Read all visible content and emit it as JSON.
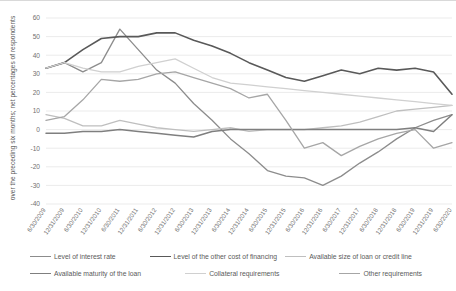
{
  "chart_data": {
    "type": "line",
    "title": "",
    "xlabel": "",
    "ylabel": "over the preceding six months; net percentages of respondents",
    "ylim": [
      -40,
      60
    ],
    "yticks": [
      60,
      50,
      40,
      30,
      20,
      10,
      0,
      -10,
      -20,
      -30,
      -40
    ],
    "grid": true,
    "legend_position": "bottom",
    "categories": [
      "6/30/2009",
      "12/31/2009",
      "6/30/2010",
      "12/31/2010",
      "6/30/2011",
      "12/31/2011",
      "6/30/2012",
      "12/31/2012",
      "6/30/2013",
      "12/31/2013",
      "6/30/2014",
      "12/31/2014",
      "6/30/2015",
      "12/31/2015",
      "6/30/2016",
      "12/31/2016",
      "6/30/2017",
      "12/31/2017",
      "6/30/2018",
      "12/31/2018",
      "6/30/2019",
      "12/31/2019",
      "6/30/2020"
    ],
    "series": [
      {
        "name": "Level of interest rate",
        "color": "#8c8c8c",
        "width": 1.3,
        "values": [
          33,
          36,
          31,
          36,
          54,
          43,
          32,
          25,
          14,
          5,
          -5,
          -13,
          -22,
          -25,
          -26,
          -30,
          -25,
          -18,
          -12,
          -5,
          1,
          5,
          8
        ]
      },
      {
        "name": "Level of the other cost of financing",
        "color": "#595959",
        "width": 1.6,
        "values": [
          33,
          36,
          43,
          49,
          50,
          50,
          52,
          52,
          48,
          45,
          41,
          36,
          32,
          28,
          26,
          29,
          32,
          30,
          33,
          32,
          33,
          31,
          19
        ]
      },
      {
        "name": "Available size of loan or credit line",
        "color": "#bfbfbf",
        "width": 1.3,
        "values": [
          8,
          6,
          2,
          2,
          5,
          3,
          1,
          0,
          -1,
          0,
          1,
          -1,
          0,
          0,
          0,
          1,
          2,
          4,
          7,
          10,
          11,
          12,
          13
        ]
      },
      {
        "name": "Available maturity of the loan",
        "color": "#7f7f7f",
        "width": 1.5,
        "values": [
          -2,
          -2,
          -1,
          -1,
          0,
          -1,
          -2,
          -3,
          -4,
          -1,
          0,
          0,
          0,
          0,
          0,
          0,
          0,
          0,
          0,
          0,
          1,
          -1,
          8
        ]
      },
      {
        "name": "Collateral requirements",
        "color": "#d0d0d0",
        "width": 1.3,
        "values": [
          33,
          36,
          33,
          31,
          31,
          34,
          36,
          38,
          33,
          28,
          25,
          24,
          23,
          22,
          21,
          20,
          19,
          18,
          17,
          16,
          15,
          14,
          13
        ]
      },
      {
        "name": "Other requirements",
        "color": "#a6a6a6",
        "width": 1.3,
        "values": [
          5,
          7,
          16,
          27,
          26,
          27,
          30,
          31,
          28,
          25,
          22,
          17,
          19,
          5,
          -10,
          -7,
          -14,
          -9,
          -5,
          -2,
          0,
          -10,
          -7
        ]
      }
    ]
  },
  "legend": {
    "items": [
      {
        "label": "Level of interest rate"
      },
      {
        "label": "Level of the other cost of financing"
      },
      {
        "label": "Available size of loan or credit line"
      },
      {
        "label": "Available maturity of the loan"
      },
      {
        "label": "Collateral requirements"
      },
      {
        "label": "Other requirements"
      }
    ]
  }
}
